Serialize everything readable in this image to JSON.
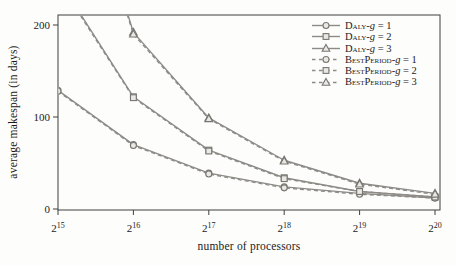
{
  "chart_data": {
    "type": "line",
    "title": "",
    "xlabel": "number of processors",
    "ylabel": "average makespan (in days)",
    "x_tick_base": "2",
    "x_tick_exponents": [
      "15",
      "16",
      "17",
      "18",
      "19",
      "20"
    ],
    "categories": [
      "2^15",
      "2^16",
      "2^17",
      "2^18",
      "2^19",
      "2^20"
    ],
    "y_ticks": [
      0,
      100,
      200
    ],
    "ylim": [
      0,
      210
    ],
    "grid": false,
    "legend_position": "top-right-inside",
    "series": [
      {
        "name": "Daly-g = 1",
        "marker": "circle",
        "line": "solid",
        "values": [
          129,
          70,
          39,
          24,
          17,
          12
        ]
      },
      {
        "name": "Daly-g = 2",
        "marker": "square",
        "line": "solid",
        "values": [
          250,
          122,
          64,
          34,
          19,
          13
        ],
        "clipped_above_ymax": true
      },
      {
        "name": "Daly-g = 3",
        "marker": "triangle",
        "line": "solid",
        "values": [
          455,
          192,
          99,
          53,
          28,
          17
        ],
        "clipped_above_ymax": true
      },
      {
        "name": "BestPeriod-g = 1",
        "marker": "circle",
        "line": "dashed",
        "values": [
          128,
          69,
          38,
          23,
          16,
          12
        ]
      },
      {
        "name": "BestPeriod-g = 2",
        "marker": "square",
        "line": "dashed",
        "values": [
          248,
          121,
          63,
          33,
          19,
          13
        ],
        "clipped_above_ymax": true
      },
      {
        "name": "BestPeriod-g = 3",
        "marker": "triangle",
        "line": "dashed",
        "values": [
          451,
          190,
          98,
          52,
          27,
          16
        ],
        "clipped_above_ymax": true
      }
    ],
    "colors": {
      "line": "#8d8b87",
      "marker_fill": "#eae8e3",
      "marker_stroke": "#787672",
      "axis": "#3f3f3f",
      "text": "#1b1b1b",
      "background": "#fdfdfb"
    }
  }
}
